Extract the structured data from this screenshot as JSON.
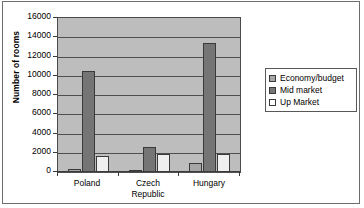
{
  "chart_data": {
    "type": "bar",
    "title": "",
    "xlabel": "",
    "ylabel": "Number of rooms",
    "ylim": [
      0,
      16000
    ],
    "ytick_step": 2000,
    "grid": true,
    "legend_position": "right",
    "categories": [
      "Poland",
      "Czech Republic",
      "Hungary"
    ],
    "series": [
      {
        "name": "Economy/budget",
        "values": [
          300,
          250,
          950
        ],
        "color": "#a6a6a6"
      },
      {
        "name": "Mid market",
        "values": [
          10500,
          2600,
          13400
        ],
        "color": "#757575"
      },
      {
        "name": "Up  Market",
        "values": [
          1700,
          1900,
          1850
        ],
        "color": "#efefef"
      }
    ],
    "ytick_labels": [
      "16000",
      "14000",
      "12000",
      "10000",
      "8000",
      "6000",
      "4000",
      "2000",
      "0"
    ],
    "xtick_labels": [
      {
        "lines": [
          "Poland"
        ]
      },
      {
        "lines": [
          "Czech",
          "Republic"
        ]
      },
      {
        "lines": [
          "Hungary"
        ]
      }
    ]
  },
  "legend": {
    "items": [
      {
        "label": "Economy/budget",
        "swatch": "economy-swatch-icon"
      },
      {
        "label": "Mid market",
        "swatch": "mid-market-swatch-icon"
      },
      {
        "label": "Up  Market",
        "swatch": "up-market-swatch-icon"
      }
    ]
  },
  "colors": {
    "plot_background": "#bdbdbd",
    "figure_background": "#ffffff",
    "axis": "#3c3c3c",
    "gridline": "#4f4f4f",
    "economy": "#a6a6a6",
    "mid_market": "#757575",
    "up_market": "#efefef"
  }
}
